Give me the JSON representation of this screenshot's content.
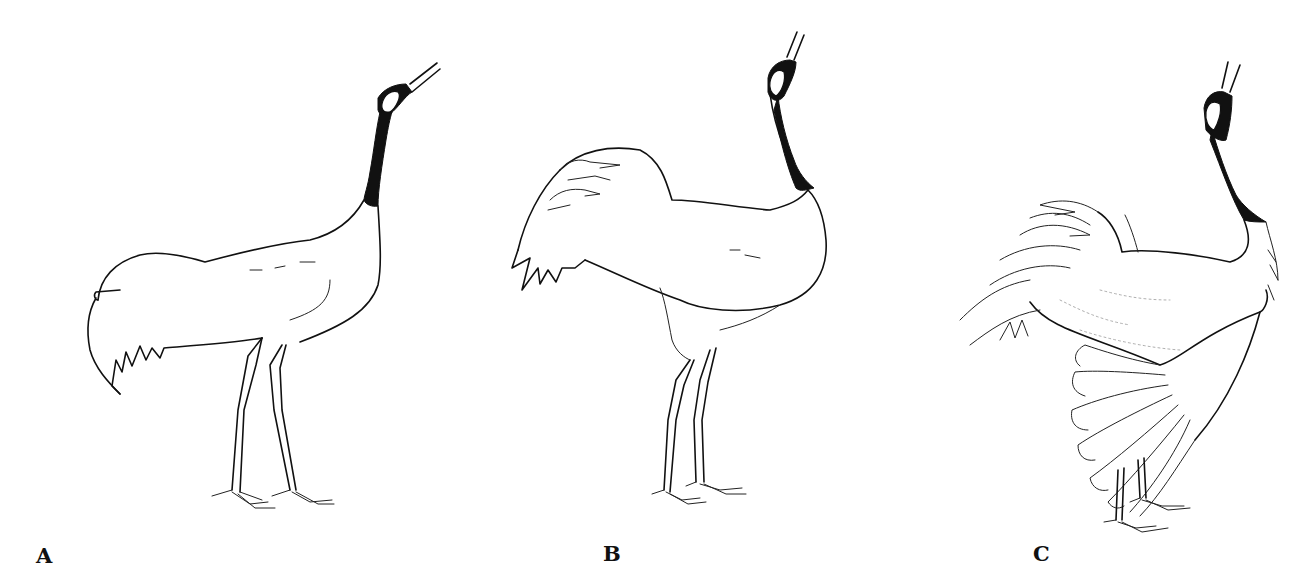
{
  "figure": {
    "panels": [
      {
        "id": "A",
        "label": "A",
        "pose": "standing, neck raised, bill open, tail drooping"
      },
      {
        "id": "B",
        "label": "B",
        "pose": "standing upright, neck vertical, bill open, tail feathers raised"
      },
      {
        "id": "C",
        "label": "C",
        "pose": "standing upright, neck vertical, bill open, wings partially spread and drooping"
      }
    ],
    "colors": {
      "ink": "#111111",
      "background": "#ffffff"
    }
  }
}
